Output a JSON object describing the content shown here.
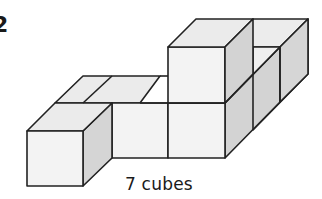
{
  "question_number": "2",
  "caption": "7 cubes",
  "figure": {
    "cube_count": 7,
    "colors": {
      "front_face": "#f2f2f2",
      "top_face": "#e9e9e9",
      "side_face": "#d2d2d2",
      "edge": "#222222"
    }
  }
}
